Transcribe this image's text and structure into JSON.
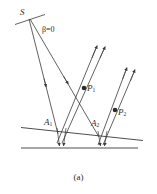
{
  "figure": {
    "caption": "(a)",
    "stroke_color": "#3a3a3a",
    "background_color": "#ffffff",
    "text_color": "#2b2b2b"
  },
  "labels": {
    "source": "S",
    "beta": "β=0",
    "p1": "P",
    "p1_sub": "1",
    "p2": "P",
    "p2_sub": "2",
    "a1": "A",
    "a1_sub": "1",
    "a2": "A",
    "a2_sub": "2"
  },
  "diagram_data": {
    "type": "optical-ray-diagram",
    "description": "Point source S emits two incident rays that strike a lower reflecting surface at A1 and A2; scattered rays travel upward through points P1 and P2.",
    "points": [
      {
        "name": "S",
        "x": 29,
        "y": 18,
        "marker": "none"
      },
      {
        "name": "A1",
        "x": 58,
        "y": 134,
        "marker": "none"
      },
      {
        "name": "A2",
        "x": 99,
        "y": 137,
        "marker": "none"
      },
      {
        "name": "P1",
        "x": 84,
        "y": 88,
        "marker": "dot"
      },
      {
        "name": "P2",
        "x": 115,
        "y": 110,
        "marker": "dot"
      }
    ],
    "surfaces": [
      {
        "name": "upper-interface",
        "x1": 21,
        "y1": 128,
        "x2": 143,
        "y2": 140
      },
      {
        "name": "lower-interface",
        "x1": 21,
        "y1": 148,
        "x2": 138,
        "y2": 148
      }
    ],
    "source_marker": {
      "name": "wavefront-tick",
      "x1": 15,
      "y1": 24,
      "x2": 45,
      "y2": 14
    },
    "incident_rays": [
      {
        "from": "S",
        "to": "A1",
        "arrow_at": 0.62
      },
      {
        "from": "S",
        "to": "A2",
        "arrow_at": 0.56
      }
    ],
    "scattered_rays": [
      {
        "from": "A1",
        "through": "P1",
        "to_x": 96,
        "to_y": 44
      },
      {
        "from": "A1",
        "through": null,
        "to_x": 104,
        "to_y": 45
      },
      {
        "from": "A2",
        "through": "P2",
        "to_x": 126,
        "to_y": 66
      },
      {
        "from": "A2",
        "through": null,
        "to_x": 134,
        "to_y": 68
      }
    ]
  }
}
